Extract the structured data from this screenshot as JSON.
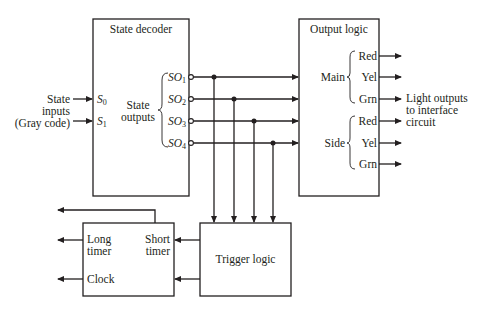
{
  "diagram": {
    "state_decoder": {
      "title": "State decoder",
      "inputs_label": [
        "State",
        "inputs",
        "(Gray code)"
      ],
      "inputs": [
        {
          "name": "S",
          "sub": "0"
        },
        {
          "name": "S",
          "sub": "1"
        }
      ],
      "outputs_label": [
        "State",
        "outputs"
      ],
      "outputs": [
        {
          "name": "SO",
          "sub": "1"
        },
        {
          "name": "SO",
          "sub": "2"
        },
        {
          "name": "SO",
          "sub": "3"
        },
        {
          "name": "SO",
          "sub": "4"
        }
      ]
    },
    "output_logic": {
      "title": "Output logic",
      "groups": [
        {
          "label": "Main",
          "signals": [
            "Red",
            "Yel",
            "Grn"
          ]
        },
        {
          "label": "Side",
          "signals": [
            "Red",
            "Yel",
            "Grn"
          ]
        }
      ],
      "outputs_note": [
        "Light outputs",
        "to interface",
        "circuit"
      ]
    },
    "timer": {
      "long_timer": [
        "Long",
        "timer"
      ],
      "short_timer": [
        "Short",
        "timer"
      ],
      "clock": "Clock"
    },
    "trigger_logic": {
      "title": "Trigger logic"
    }
  }
}
